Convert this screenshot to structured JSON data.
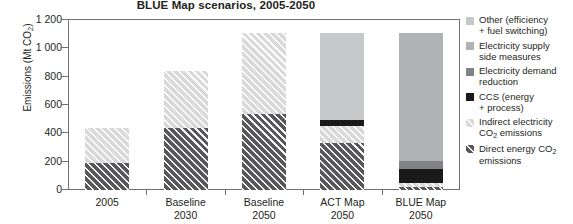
{
  "chart_data": {
    "type": "bar",
    "stacked": true,
    "title": "BLUE Map scenarios, 2005-2050",
    "xlabel": "",
    "ylabel": "Emissions (Mt CO2)",
    "ylabel_parts": {
      "main": "Emissions (Mt CO",
      "sub": "2",
      "tail": ")"
    },
    "ylim": [
      0,
      1200
    ],
    "yticks": [
      0,
      200,
      400,
      600,
      800,
      1000,
      1200
    ],
    "ytick_labels": [
      "0",
      "200",
      "400",
      "600",
      "800",
      "1 000",
      "1 200"
    ],
    "grid": false,
    "legend_position": "right",
    "categories": [
      "2005",
      "Baseline 2030",
      "Baseline 2050",
      "ACT Map 2050",
      "BLUE Map 2050"
    ],
    "category_labels": [
      {
        "line1": "2005",
        "line2": ""
      },
      {
        "line1": "Baseline",
        "line2": "2030"
      },
      {
        "line1": "Baseline",
        "line2": "2050"
      },
      {
        "line1": "ACT Map",
        "line2": "2050"
      },
      {
        "line1": "BLUE Map",
        "line2": "2050"
      }
    ],
    "series": [
      {
        "name": "Direct energy CO2 emissions",
        "key": "direct",
        "color": "#58585b",
        "pattern": "diagonal-hatch",
        "values": [
          190,
          435,
          535,
          335,
          20
        ]
      },
      {
        "name": "Indirect electricity CO2 emissions",
        "key": "indirect",
        "color": "#d9d9d9",
        "pattern": "diagonal-hatch",
        "values": [
          245,
          405,
          575,
          120,
          30
        ]
      },
      {
        "name": "CCS (energy + process)",
        "key": "ccs",
        "color": "#1a1a1a",
        "pattern": "solid",
        "values": [
          0,
          0,
          0,
          40,
          100
        ]
      },
      {
        "name": "Electricity demand reduction",
        "key": "demand",
        "color": "#808285",
        "pattern": "solid",
        "values": [
          0,
          0,
          0,
          0,
          55
        ]
      },
      {
        "name": "Electricity supply side measures",
        "key": "supply",
        "color": "#b0b2b4",
        "pattern": "solid",
        "values": [
          0,
          0,
          0,
          0,
          905
        ]
      },
      {
        "name": "Other (efficiency + fuel switching)",
        "key": "other",
        "color": "#c7c8ca",
        "pattern": "solid",
        "values": [
          0,
          0,
          0,
          615,
          0
        ]
      }
    ],
    "totals": [
      435,
      840,
      1110,
      1110,
      1110
    ]
  },
  "legend": {
    "items": [
      {
        "key": "other",
        "color": "#c7c8ca",
        "line1": "Other (efficiency",
        "line2": "+ fuel switching)",
        "sub": ""
      },
      {
        "key": "supply",
        "color": "#b0b2b4",
        "line1": "Electricity supply",
        "line2": "side measures",
        "sub": ""
      },
      {
        "key": "demand",
        "color": "#808285",
        "line1": "Electricity demand",
        "line2": "reduction",
        "sub": ""
      },
      {
        "key": "ccs",
        "color": "#1a1a1a",
        "line1": "CCS (energy",
        "line2": "+ process)",
        "sub": ""
      },
      {
        "key": "indirect",
        "color": "#d9d9d9",
        "line1": "Indirect electricity",
        "line2": "CO",
        "sub": "2",
        "line2_tail": " emissions"
      },
      {
        "key": "direct",
        "color": "#58585b",
        "line1": "Direct energy CO",
        "line1_sub": "2",
        "line2": "emissions",
        "sub": ""
      }
    ]
  }
}
